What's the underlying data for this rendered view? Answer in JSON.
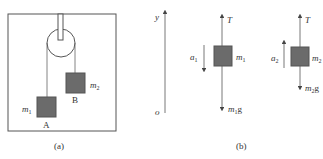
{
  "figure_a": {
    "caption": "(a)",
    "block_a": {
      "letter": "A",
      "mass": "m",
      "mass_sub": "1"
    },
    "block_b": {
      "letter": "B",
      "mass": "m",
      "mass_sub": "2"
    }
  },
  "figure_b": {
    "caption": "(b)",
    "axis": {
      "y_label": "y",
      "origin_label": "o"
    },
    "body1": {
      "tension": "T",
      "mass": "m",
      "mass_sub": "1",
      "weight": "m",
      "weight_sub": "1",
      "weight_g": "g",
      "accel": "a",
      "accel_sub": "1"
    },
    "body2": {
      "tension": "T",
      "mass": "m",
      "mass_sub": "2",
      "weight": "m",
      "weight_sub": "2",
      "weight_g": "g",
      "accel": "a",
      "accel_sub": "2"
    }
  },
  "colors": {
    "line": "#555555",
    "block": "#6b6b6b",
    "block_edge": "#555555",
    "text": "#333333"
  }
}
